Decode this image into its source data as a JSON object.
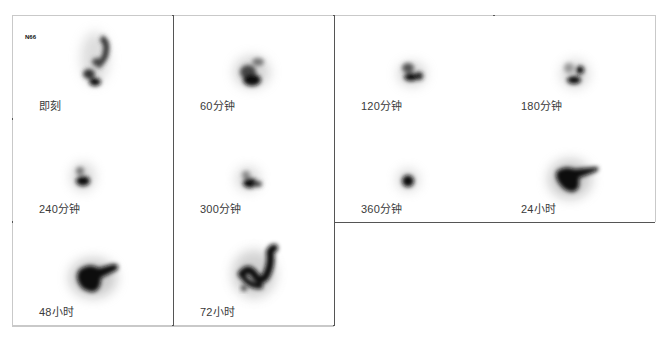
{
  "figure": {
    "subject_tag": "N66",
    "panels": [
      {
        "label": "即刻",
        "blob": "scattered-vertical"
      },
      {
        "label": "60分钟",
        "blob": "compact-cluster"
      },
      {
        "label": "120分钟",
        "blob": "compact-cluster-small"
      },
      {
        "label": "180分钟",
        "blob": "two-dots"
      },
      {
        "label": "240分钟",
        "blob": "small-spot"
      },
      {
        "label": "300分钟",
        "blob": "small-spot-tail"
      },
      {
        "label": "360分钟",
        "blob": "round-dot"
      },
      {
        "label": "24小时",
        "blob": "hooked-mass"
      },
      {
        "label": "48小时",
        "blob": "hooked-mass-large"
      },
      {
        "label": "72小时",
        "blob": "s-curve"
      }
    ]
  }
}
